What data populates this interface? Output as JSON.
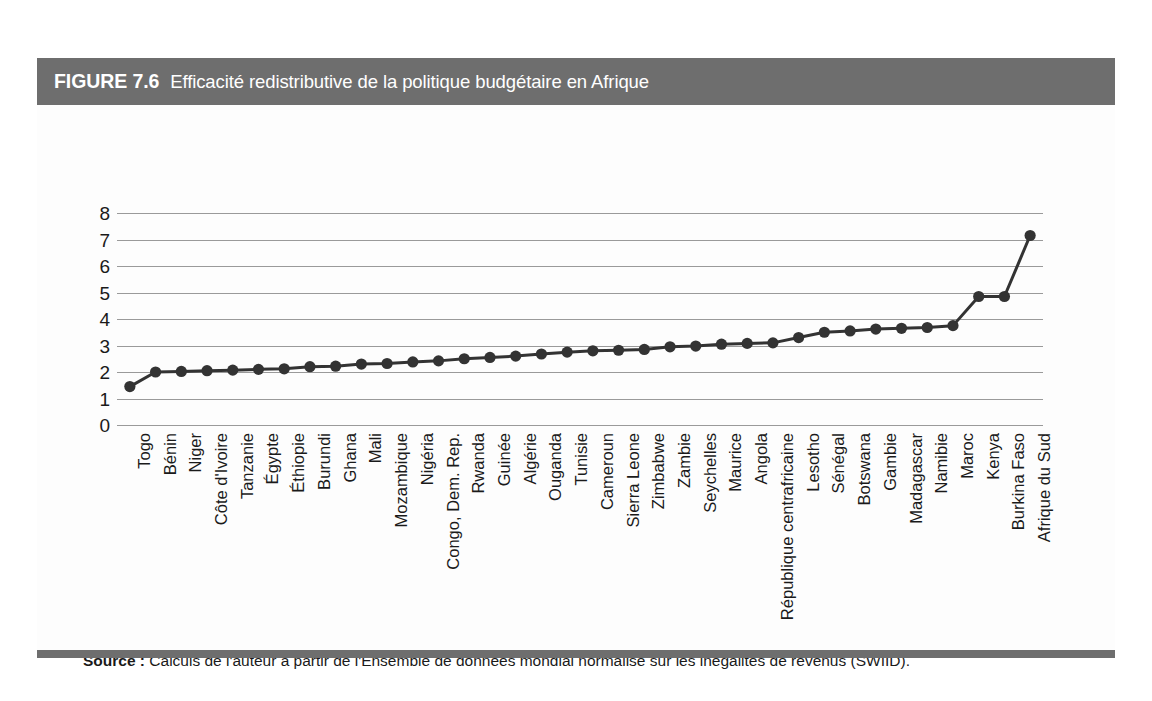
{
  "figure": {
    "number": "FIGURE 7.6",
    "title": "Efficacité redistributive de la politique budgétaire en Afrique",
    "header_bg": "#6e6e6e",
    "header_text_color": "#ffffff"
  },
  "source": {
    "label": "Source :",
    "text": " Calculs de l'auteur à partir de l'Ensemble de données mondial normalisé sur les inégalités de revenus (SWIID)."
  },
  "chart_data": {
    "type": "line",
    "title": "Efficacité redistributive de la politique budgétaire en Afrique",
    "xlabel": "",
    "ylabel": "",
    "ylim": [
      0,
      8
    ],
    "yticks": [
      0,
      1,
      2,
      3,
      4,
      5,
      6,
      7,
      8
    ],
    "grid": true,
    "legend": "none",
    "marker": "filled-circle",
    "series_color": "#333333",
    "categories": [
      "Togo",
      "Bénin",
      "Niger",
      "Côte d'Ivoire",
      "Tanzanie",
      "Égypte",
      "Éthiopie",
      "Burundi",
      "Ghana",
      "Mali",
      "Mozambique",
      "Nigéria",
      "Congo, Dem. Rep.",
      "Rwanda",
      "Guinée",
      "Algérie",
      "Ouganda",
      "Tunisie",
      "Cameroun",
      "Sierra Leone",
      "Zimbabwe",
      "Zambie",
      "Seychelles",
      "Maurice",
      "Angola",
      "République centrafricaine",
      "Lesotho",
      "Sénégal",
      "Botswana",
      "Gambie",
      "Madagascar",
      "Namibie",
      "Maroc",
      "Kenya",
      "Burkina Faso",
      "Afrique du Sud"
    ],
    "values": [
      1.45,
      2.0,
      2.02,
      2.05,
      2.07,
      2.1,
      2.12,
      2.2,
      2.22,
      2.3,
      2.32,
      2.38,
      2.42,
      2.5,
      2.55,
      2.6,
      2.68,
      2.75,
      2.8,
      2.82,
      2.85,
      2.95,
      2.98,
      3.05,
      3.08,
      3.1,
      3.3,
      3.5,
      3.55,
      3.62,
      3.65,
      3.68,
      3.75,
      4.85,
      4.85,
      7.15
    ]
  }
}
